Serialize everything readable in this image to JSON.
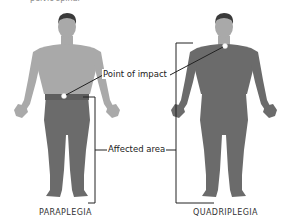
{
  "diagram": {
    "top_fragment": "pelvic spinal",
    "figures": [
      {
        "id": "paraplegia",
        "caption": "PARAPLEGIA",
        "impact_point": "waist / lower back",
        "affected_region": "legs and lower body"
      },
      {
        "id": "quadriplegia",
        "caption": "QUADRIPLEGIA",
        "impact_point": "neck",
        "affected_region": "body from neck down"
      }
    ],
    "labels": {
      "point_of_impact": "Point of impact",
      "affected_area": "Affected area"
    },
    "colors": {
      "skin": "#a9a9a9",
      "affected": "#6b6b6b",
      "hair": "#3a3a3a",
      "line": "#222222",
      "impact_dot": "#ffffff",
      "background": "#ffffff"
    }
  }
}
